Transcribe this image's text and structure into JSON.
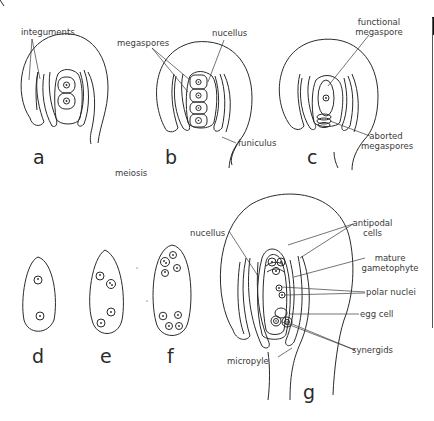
{
  "diagram": {
    "stages": {
      "a": "a",
      "b": "b",
      "c": "c",
      "d": "d",
      "e": "e",
      "f": "f",
      "g": "g"
    },
    "process_labels": {
      "meiosis": "meiosis"
    },
    "labels": {
      "integuments": "integuments",
      "megaspores": "megaspores",
      "nucellus_b": "nucellus",
      "funiculus": "funiculus",
      "functional_megaspore_1": "functional",
      "functional_megaspore_2": "megaspore",
      "aborted_megaspores_1": "aborted",
      "aborted_megaspores_2": "megaspores",
      "nucellus_g": "nucellus",
      "antipodal_cells_1": "antipodal",
      "antipodal_cells_2": "cells",
      "mature_gametophyte_1": "mature",
      "mature_gametophyte_2": "gametophyte",
      "polar_nuclei": "polar nuclei",
      "egg_cell": "egg cell",
      "synergids": "synergids",
      "micropyle": "micropyle"
    },
    "colors": {
      "line": "#2a2a2a",
      "label": "#3a3a3a",
      "background": "#ffffff"
    }
  }
}
